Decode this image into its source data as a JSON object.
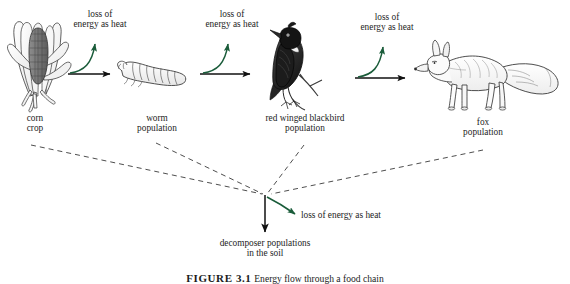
{
  "figure": {
    "type": "energy-flow-food-chain-diagram",
    "caption_label": "FIGURE 3.1",
    "caption_text": "Energy flow through a food chain",
    "arrow_color_energy_transfer": "#000000",
    "arrow_color_heat_loss": "#1a5c3a",
    "dashed_line_color": "#444444",
    "background": "#ffffff"
  },
  "heat_labels": {
    "line1": "loss of",
    "line2": "energy as heat",
    "inline": "loss of energy as heat"
  },
  "trophic_levels": [
    {
      "id": "corn",
      "icon": "corn-icon",
      "label_line1": "corn",
      "label_line2": "crop"
    },
    {
      "id": "worm",
      "icon": "worm-icon",
      "label_line1": "worm",
      "label_line2": "population"
    },
    {
      "id": "blackbird",
      "icon": "blackbird-icon",
      "label_line1": "red winged blackbird",
      "label_line2": "population"
    },
    {
      "id": "fox",
      "icon": "fox-icon",
      "label_line1": "fox",
      "label_line2": "population"
    }
  ],
  "decomposer": {
    "label_line1": "decomposer populations",
    "label_line2": "in the soil"
  },
  "heat_arrows_count": 4
}
